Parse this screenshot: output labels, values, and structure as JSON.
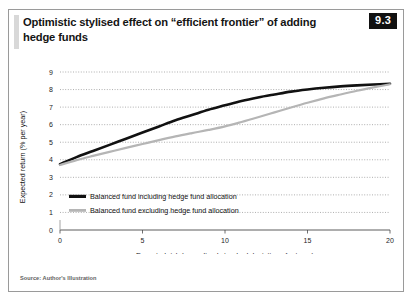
{
  "figure": {
    "title": "Optimistic stylised effect on “efficient frontier” of adding hedge funds",
    "number": "9.3",
    "source": "Source: Author's Illustration",
    "border_color": "#9a9a9a",
    "accent_color": "#d8d8d8",
    "badge_bg": "#111111",
    "badge_fg": "#ffffff"
  },
  "chart_data": {
    "type": "line",
    "title": "Optimistic stylised effect on “efficient frontier” of adding hedge funds",
    "xlabel": "Expected risk (annualised standard deviation of returns)",
    "ylabel": "Expected return (% per year)",
    "xlim": [
      0,
      20
    ],
    "ylim": [
      0,
      9
    ],
    "xticks": [
      0,
      5,
      10,
      15,
      20
    ],
    "yticks": [
      0,
      1,
      2,
      3,
      4,
      5,
      6,
      7,
      8,
      9
    ],
    "grid": "horizontal-dotted",
    "legend_position": "inside-lower-left",
    "series": [
      {
        "name": "Balanced fund including hedge fund allocation",
        "color": "#111111",
        "width": 2.6,
        "x": [
          0,
          1,
          2,
          3,
          4,
          5,
          6,
          7,
          8,
          9,
          10,
          11,
          12,
          13,
          14,
          15,
          16,
          17,
          18,
          19,
          20
        ],
        "y": [
          3.75,
          4.15,
          4.5,
          4.85,
          5.2,
          5.55,
          5.9,
          6.25,
          6.55,
          6.85,
          7.1,
          7.35,
          7.55,
          7.72,
          7.88,
          8.0,
          8.1,
          8.18,
          8.24,
          8.29,
          8.33
        ]
      },
      {
        "name": "Balanced fund excluding hedge fund allocation",
        "color": "#b5b5b5",
        "width": 2.2,
        "x": [
          0,
          1,
          2,
          3,
          4,
          5,
          6,
          7,
          8,
          9,
          10,
          11,
          12,
          13,
          14,
          15,
          16,
          17,
          18,
          19,
          20
        ],
        "y": [
          3.7,
          3.98,
          4.22,
          4.45,
          4.68,
          4.9,
          5.12,
          5.33,
          5.52,
          5.7,
          5.9,
          6.15,
          6.42,
          6.7,
          6.98,
          7.25,
          7.5,
          7.72,
          7.93,
          8.12,
          8.3
        ]
      }
    ]
  }
}
